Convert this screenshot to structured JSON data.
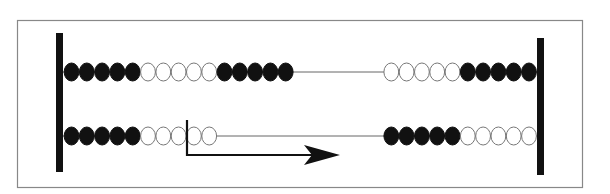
{
  "diagram": {
    "type": "bead-rack",
    "colors": {
      "filled": "#111111",
      "empty": "#ffffff",
      "bead_outline": "#777777",
      "wire": "#666666",
      "post": "#111111",
      "frame": "#888888",
      "arrow": "#111111"
    },
    "rows": [
      {
        "name": "row-1",
        "left_group": [
          "filled",
          "filled",
          "filled",
          "filled",
          "filled",
          "empty",
          "empty",
          "empty",
          "empty",
          "empty",
          "filled",
          "filled",
          "filled",
          "filled",
          "filled"
        ],
        "right_group": [
          "empty",
          "empty",
          "empty",
          "empty",
          "empty",
          "filled",
          "filled",
          "filled",
          "filled",
          "filled"
        ]
      },
      {
        "name": "row-2",
        "left_group": [
          "filled",
          "filled",
          "filled",
          "filled",
          "filled",
          "empty",
          "empty",
          "empty",
          "empty",
          "empty"
        ],
        "right_group": [
          "filled",
          "filled",
          "filled",
          "filled",
          "filled",
          "empty",
          "empty",
          "empty",
          "empty",
          "empty"
        ]
      }
    ],
    "arrow": {
      "meaning": "slide beads to the right",
      "direction": "right",
      "marker_after_bead_index": 7
    }
  }
}
